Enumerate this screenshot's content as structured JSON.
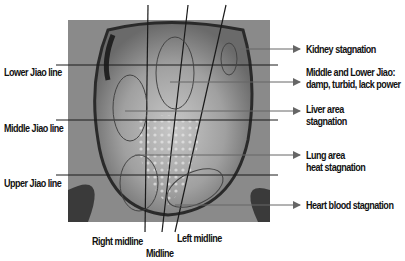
{
  "diagram": {
    "type": "annotated tongue photograph",
    "left_labels": [
      {
        "id": "lower-jiao",
        "text": "Lower Jiao line"
      },
      {
        "id": "middle-jiao",
        "text": "Middle Jiao line"
      },
      {
        "id": "upper-jiao",
        "text": "Upper Jiao line"
      }
    ],
    "right_labels": [
      {
        "id": "kidney",
        "line1": "Kidney stagnation",
        "line2": ""
      },
      {
        "id": "middle-lower",
        "line1": "Middle and Lower Jiao:",
        "line2": "damp, turbid, lack power"
      },
      {
        "id": "liver",
        "line1": "Liver area",
        "line2": "stagnation"
      },
      {
        "id": "lung",
        "line1": "Lung area",
        "line2": "heat stagnation"
      },
      {
        "id": "heart",
        "line1": "Heart blood stagnation",
        "line2": ""
      }
    ],
    "bottom_labels": [
      {
        "id": "right-midline",
        "text": "Right midline"
      },
      {
        "id": "midline",
        "text": "Midline"
      },
      {
        "id": "left-midline",
        "text": "Left midline"
      }
    ],
    "colors": {
      "line": "#1a1a1a",
      "arrow": "#666666",
      "ellipse": "#444444"
    }
  }
}
